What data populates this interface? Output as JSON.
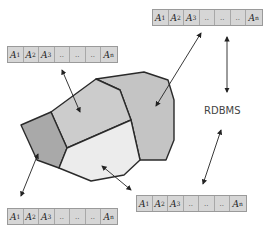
{
  "diagram": {
    "label": "RDBMS",
    "relation_columns": [
      "A1",
      "A2",
      "A3",
      "..",
      "..",
      "..",
      "An"
    ],
    "tables": [
      {
        "id": "top-right",
        "x": 152,
        "y": 9
      },
      {
        "id": "left",
        "x": 7,
        "y": 46
      },
      {
        "id": "bottom-left",
        "x": 7,
        "y": 208
      },
      {
        "id": "bottom-right",
        "x": 136,
        "y": 195
      }
    ],
    "colors": {
      "region_dark": "#a9a9a9",
      "region_mid": "#cccccc",
      "region_right": "#c4c4c4",
      "region_light": "#ececec",
      "table_fill": "#d6d6d6",
      "outline": "#2a2a2a"
    }
  }
}
